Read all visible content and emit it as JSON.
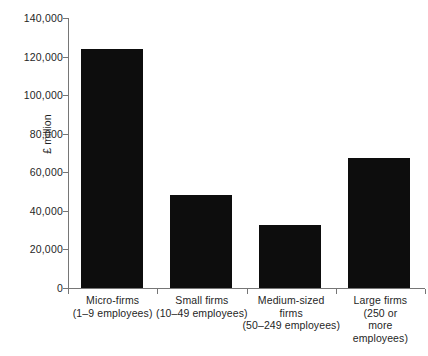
{
  "chart_data": {
    "type": "bar",
    "title": "",
    "subtitle": "",
    "xlabel": "",
    "ylabel": "£ million",
    "ylim": [
      0,
      140000
    ],
    "grid": false,
    "legend": "none",
    "categories": [
      "Micro-firms (1–9 employees)",
      "Small firms (10–49 employees)",
      "Medium-sized firms (50–249 employees)",
      "Large firms (250 or more employees)"
    ],
    "values": [
      124000,
      48000,
      32500,
      67500
    ],
    "series": [
      {
        "name": "Turnover",
        "values": [
          124000,
          48000,
          32500,
          67500
        ]
      }
    ],
    "ytick_labels": [
      "140,000",
      "120,000",
      "100,000",
      "80,000",
      "60,000",
      "40,000",
      "20,000",
      "0"
    ],
    "ytick_values": [
      140000,
      120000,
      100000,
      80000,
      60000,
      40000,
      20000,
      0
    ],
    "bar_color": "#0d0d0d",
    "axis_color": "#767676",
    "background_color": "#ffffff",
    "category_labels": [
      {
        "lines": [
          "Micro-firms",
          "(1–9 employees)"
        ]
      },
      {
        "lines": [
          "Small firms",
          "(10–49 employees)"
        ]
      },
      {
        "lines": [
          "Medium-sized",
          "firms",
          "(50–249 employees)"
        ]
      },
      {
        "lines": [
          "Large firms",
          "(250 or",
          "more",
          "employees)"
        ]
      }
    ]
  }
}
